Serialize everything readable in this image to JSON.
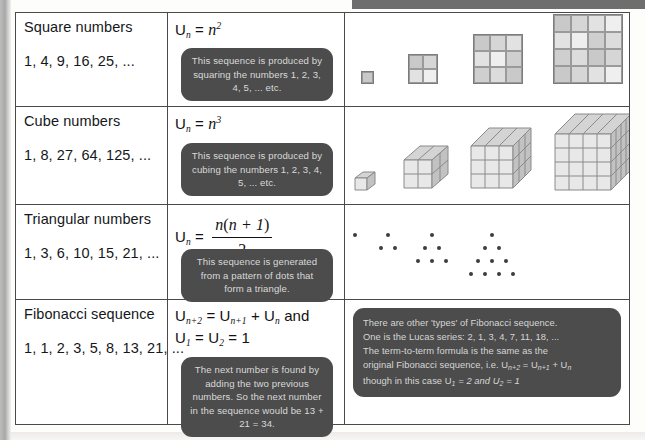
{
  "table": {
    "rows": [
      {
        "name": "Square numbers",
        "values": "1, 4, 9, 16, 25, ...",
        "formula_plain": "Un = n2",
        "callout": "This sequence is produced by squaring the numbers 1, 2, 3, 4, 5, ... etc.",
        "visual": "squares"
      },
      {
        "name": "Cube numbers",
        "values": "1, 8, 27, 64, 125, ...",
        "formula_plain": "Un = n3",
        "callout": "This sequence is produced by cubing the numbers 1, 2, 3, 4, 5, ... etc.",
        "visual": "cubes"
      },
      {
        "name": "Triangular numbers",
        "values": "1, 3, 6, 10, 15, 21, ...",
        "formula_plain": "Un = n(n + 1) / 2",
        "callout": "This sequence is generated from a pattern of dots that form a triangle.",
        "visual": "dot-triangles"
      },
      {
        "name": "Fibonacci sequence",
        "values": "1, 1, 2, 3, 5, 8, 13, 21, ...",
        "formula_plain": "Un+2 = Un+1 + Un and U1 = U2 = 1",
        "callout": "The next number is found by adding the two previous numbers. So the next number in the sequence would be 13 + 21 = 34.",
        "visual": "fibonacci-note",
        "note": {
          "line1": "There are other 'types' of Fibonacci sequence.",
          "line2": "One is the Lucas series: 2, 1, 3, 4, 7, 11, 18, ...",
          "line3": "The term-to-term formula is the same as the",
          "line4_pre": "original Fibonacci sequence, i.e. U",
          "line4_sub1": "n+2",
          "line4_mid": " = U",
          "line4_sub2": "n+1",
          "line4_post": " + U",
          "line4_sub3": "n",
          "line5_pre": "though in this case U",
          "line5_sub1": "1",
          "line5_mid": " = 2  and U",
          "line5_sub2": "2",
          "line5_post": " = 1"
        }
      }
    ]
  },
  "chart_data": {
    "type": "table",
    "columns": [
      "Sequence name and terms",
      "nth term formula",
      "Visual representation"
    ],
    "sequences": [
      {
        "name": "Square numbers",
        "terms": [
          1,
          4,
          9,
          16,
          25
        ],
        "formula": "U_n = n^2",
        "diagram_sizes": [
          1,
          2,
          3,
          4
        ]
      },
      {
        "name": "Cube numbers",
        "terms": [
          1,
          8,
          27,
          64,
          125
        ],
        "formula": "U_n = n^3",
        "diagram_sizes": [
          1,
          2,
          3,
          4
        ]
      },
      {
        "name": "Triangular numbers",
        "terms": [
          1,
          3,
          6,
          10,
          15,
          21
        ],
        "formula": "U_n = n(n+1)/2",
        "diagram_dot_counts": [
          1,
          3,
          6,
          10
        ]
      },
      {
        "name": "Fibonacci sequence",
        "terms": [
          1,
          1,
          2,
          3,
          5,
          8,
          13,
          21
        ],
        "formula": "U_(n+2) = U_(n+1) + U_n, U_1 = U_2 = 1",
        "next_term": 34
      },
      {
        "name": "Lucas series",
        "terms": [
          2,
          1,
          3,
          4,
          7,
          11,
          18
        ],
        "formula": "U_(n+2) = U_(n+1) + U_n, U_1 = 2, U_2 = 1"
      }
    ]
  },
  "colors": {
    "callout_bg": "#4c4c4c",
    "callout_text": "#d9d9d9",
    "border": "#4a4a4a",
    "square_fill": "#c9c9c9",
    "dot": "#3d3d3d"
  }
}
